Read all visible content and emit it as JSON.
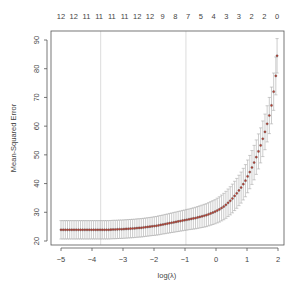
{
  "chart_data": {
    "type": "scatter",
    "title": "",
    "xlabel": "log(λ)",
    "ylabel": "Mean-Squared Error",
    "xlim": [
      -5.2,
      2.15
    ],
    "ylim": [
      19.5,
      92.5
    ],
    "x_ticks": [
      -5,
      -4,
      -3,
      -2,
      -1,
      0,
      1,
      2
    ],
    "y_ticks": [
      20,
      30,
      40,
      50,
      60,
      70,
      80,
      90
    ],
    "top_axis_labels": [
      "12",
      "12",
      "11",
      "11",
      "11",
      "11",
      "12",
      "12",
      "9",
      "8",
      "7",
      "5",
      "4",
      "3",
      "3",
      "2",
      "2",
      "0"
    ],
    "top_axis_label": "number of nonzero coefficients",
    "vlines": [
      {
        "name": "lambda.min",
        "x": -3.72
      },
      {
        "name": "lambda.1se",
        "x": -0.97
      }
    ],
    "grid": false,
    "legend": null,
    "series": [
      {
        "name": "cv mean-squared error",
        "x": [
          -5.0,
          -4.93,
          -4.86,
          -4.79,
          -4.72,
          -4.65,
          -4.58,
          -4.51,
          -4.44,
          -4.37,
          -4.3,
          -4.23,
          -4.16,
          -4.09,
          -4.02,
          -3.95,
          -3.88,
          -3.81,
          -3.74,
          -3.67,
          -3.6,
          -3.53,
          -3.46,
          -3.39,
          -3.32,
          -3.25,
          -3.18,
          -3.11,
          -3.04,
          -2.97,
          -2.9,
          -2.83,
          -2.76,
          -2.69,
          -2.62,
          -2.55,
          -2.48,
          -2.41,
          -2.34,
          -2.27,
          -2.2,
          -2.13,
          -2.06,
          -1.99,
          -1.92,
          -1.85,
          -1.78,
          -1.71,
          -1.64,
          -1.57,
          -1.5,
          -1.43,
          -1.36,
          -1.29,
          -1.22,
          -1.15,
          -1.08,
          -1.01,
          -0.94,
          -0.87,
          -0.8,
          -0.73,
          -0.66,
          -0.59,
          -0.52,
          -0.45,
          -0.38,
          -0.31,
          -0.24,
          -0.17,
          -0.1,
          -0.03,
          0.04,
          0.11,
          0.18,
          0.25,
          0.32,
          0.39,
          0.46,
          0.53,
          0.6,
          0.67,
          0.74,
          0.81,
          0.88,
          0.95,
          1.02,
          1.09,
          1.16,
          1.23,
          1.3,
          1.37,
          1.44,
          1.51,
          1.58,
          1.65,
          1.72,
          1.79,
          1.86,
          1.93
        ],
        "y": [
          23.9,
          23.9,
          23.9,
          23.9,
          23.9,
          23.9,
          23.9,
          23.9,
          23.9,
          23.9,
          23.9,
          23.9,
          23.9,
          23.9,
          23.9,
          23.9,
          23.9,
          23.9,
          23.9,
          23.9,
          23.9,
          23.9,
          23.9,
          23.95,
          24.0,
          24.0,
          24.05,
          24.1,
          24.1,
          24.15,
          24.2,
          24.25,
          24.3,
          24.35,
          24.4,
          24.5,
          24.55,
          24.6,
          24.7,
          24.8,
          24.9,
          25.0,
          25.1,
          25.2,
          25.3,
          25.45,
          25.6,
          25.75,
          25.9,
          26.05,
          26.2,
          26.35,
          26.5,
          26.65,
          26.8,
          26.95,
          27.1,
          27.25,
          27.4,
          27.55,
          27.7,
          27.85,
          28.0,
          28.2,
          28.4,
          28.6,
          28.8,
          29.0,
          29.3,
          29.6,
          29.9,
          30.2,
          30.6,
          31.0,
          31.5,
          32.0,
          32.6,
          33.3,
          34.0,
          34.8,
          35.7,
          36.6,
          37.6,
          38.6,
          39.8,
          41.0,
          42.5,
          44.0,
          45.6,
          47.3,
          49.2,
          51.2,
          53.3,
          55.6,
          58.0,
          60.8,
          63.7,
          67.2,
          72.0,
          77.5
        ],
        "err": [
          3.2,
          3.2,
          3.2,
          3.2,
          3.2,
          3.2,
          3.2,
          3.2,
          3.2,
          3.2,
          3.2,
          3.2,
          3.2,
          3.2,
          3.2,
          3.2,
          3.2,
          3.2,
          3.2,
          3.2,
          3.2,
          3.2,
          3.2,
          3.2,
          3.2,
          3.2,
          3.2,
          3.2,
          3.2,
          3.2,
          3.2,
          3.2,
          3.2,
          3.2,
          3.2,
          3.2,
          3.2,
          3.2,
          3.2,
          3.2,
          3.2,
          3.2,
          3.2,
          3.25,
          3.25,
          3.3,
          3.3,
          3.3,
          3.35,
          3.35,
          3.4,
          3.4,
          3.45,
          3.45,
          3.5,
          3.5,
          3.55,
          3.55,
          3.6,
          3.6,
          3.65,
          3.7,
          3.75,
          3.8,
          3.85,
          3.9,
          3.95,
          4.0,
          4.05,
          4.1,
          4.15,
          4.2,
          4.3,
          4.4,
          4.5,
          4.6,
          4.7,
          4.8,
          4.9,
          5.0,
          5.1,
          5.2,
          5.3,
          5.4,
          5.5,
          5.6,
          5.7,
          5.8,
          5.9,
          6.0,
          6.0,
          6.1,
          6.1,
          6.2,
          6.2,
          6.3,
          6.3,
          6.4,
          6.5,
          6.6
        ]
      }
    ],
    "last_point": {
      "x": 1.97,
      "y": 84.5,
      "err": 6.0
    }
  }
}
